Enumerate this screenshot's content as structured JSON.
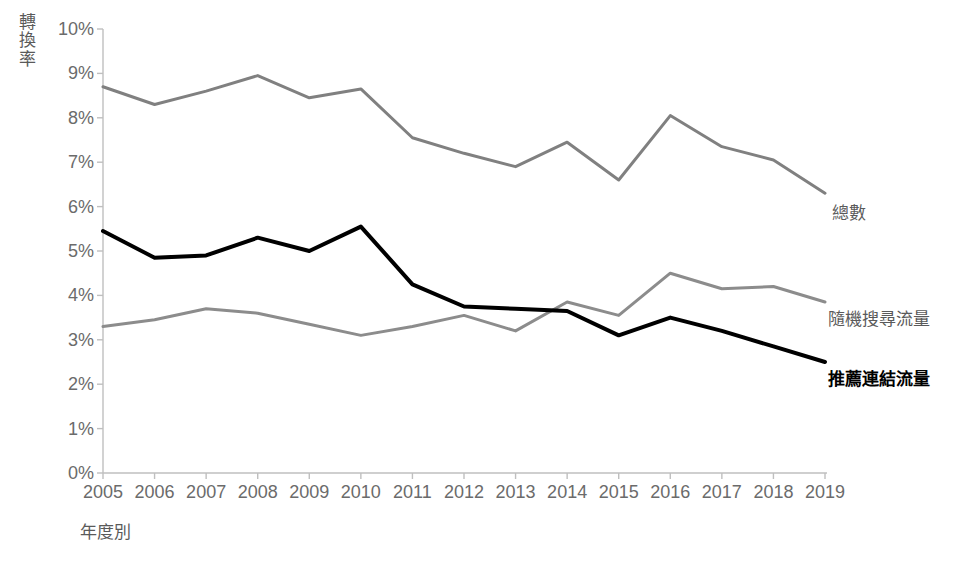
{
  "chart_data": {
    "type": "line",
    "title": "",
    "xlabel": "年度別",
    "ylabel": "轉換率",
    "x": [
      2005,
      2006,
      2007,
      2008,
      2009,
      2010,
      2011,
      2012,
      2013,
      2014,
      2015,
      2016,
      2017,
      2018,
      2019
    ],
    "categories": [
      "2005",
      "2006",
      "2007",
      "2008",
      "2009",
      "2010",
      "2011",
      "2012",
      "2013",
      "2014",
      "2015",
      "2016",
      "2017",
      "2018",
      "2019"
    ],
    "ylim": [
      0,
      10
    ],
    "yticks": [
      0,
      1,
      2,
      3,
      4,
      5,
      6,
      7,
      8,
      9,
      10
    ],
    "ytick_labels": [
      "0%",
      "1%",
      "2%",
      "3%",
      "4%",
      "5%",
      "6%",
      "7%",
      "8%",
      "9%",
      "10%"
    ],
    "grid": false,
    "legend_position": "right-of-line-ends",
    "series": [
      {
        "name": "總數",
        "color": "#808080",
        "width": 3,
        "values": [
          8.7,
          8.3,
          8.6,
          8.95,
          8.45,
          8.65,
          7.55,
          7.2,
          6.9,
          7.45,
          6.6,
          8.05,
          7.35,
          7.05,
          6.3
        ]
      },
      {
        "name": "隨機搜尋流量",
        "color": "#8c8c8c",
        "width": 3,
        "values": [
          3.3,
          3.45,
          3.7,
          3.6,
          3.35,
          3.1,
          3.3,
          3.55,
          3.2,
          3.85,
          3.55,
          4.5,
          4.15,
          4.2,
          3.85
        ]
      },
      {
        "name": "推薦連結流量",
        "color": "#000000",
        "width": 4,
        "values": [
          5.45,
          4.85,
          4.9,
          5.3,
          5.0,
          5.55,
          4.25,
          3.75,
          3.7,
          3.65,
          3.1,
          3.5,
          3.2,
          2.85,
          2.5
        ]
      }
    ],
    "axis_color": "#bfbfbf",
    "tick_label_color": "#6b6b6b"
  },
  "legend": [
    {
      "label": "總數",
      "bold": false,
      "x": 832,
      "y": 199
    },
    {
      "label": "隨機搜尋流量",
      "bold": false,
      "x": 828,
      "y": 305
    },
    {
      "label": "推薦連結流量",
      "bold": true,
      "x": 828,
      "y": 365
    }
  ],
  "axis": {
    "y_title_chars": [
      "轉",
      "換",
      "率"
    ],
    "x_title": "年度別"
  }
}
